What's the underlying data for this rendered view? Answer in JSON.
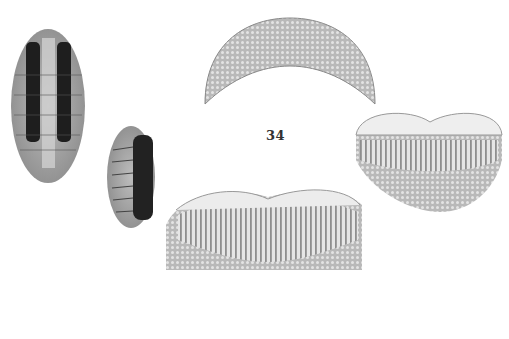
{
  "plate": {
    "figure_number": "34",
    "background": "#ffffff",
    "figures": [
      {
        "name": "chiton-dorsal-large",
        "description": "Whole chiton, dorsal view, dark dorsal bands"
      },
      {
        "name": "chiton-dorsal-small",
        "description": "Whole chiton, smaller specimen, dorsal view"
      },
      {
        "name": "anterior-valve",
        "description": "Head valve, radially ribbed granular sculpture"
      },
      {
        "name": "intermediate-valve-large",
        "description": "Intermediate valve with longitudinal ribs"
      },
      {
        "name": "intermediate-valve-right",
        "description": "Intermediate valve, oblique view"
      }
    ]
  }
}
